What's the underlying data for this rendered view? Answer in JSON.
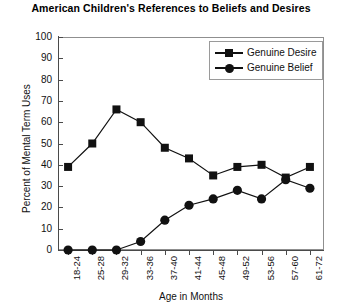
{
  "chart_data": {
    "type": "line",
    "title": "American Children's References to Beliefs and Desires",
    "xlabel": "Age in Months",
    "ylabel": "Percent of Mental Term Uses",
    "categories": [
      "18-24",
      "25-28",
      "29-32",
      "33-36",
      "37-40",
      "41-44",
      "45-48",
      "49-52",
      "53-56",
      "57-60",
      "61-72"
    ],
    "series": [
      {
        "name": "Genuine Desire",
        "marker": "square",
        "color": "#111111",
        "values": [
          39,
          50,
          66,
          60,
          48,
          43,
          35,
          39,
          40,
          34,
          39
        ]
      },
      {
        "name": "Genuine Belief",
        "marker": "circle",
        "color": "#111111",
        "values": [
          0,
          0,
          0,
          4,
          14,
          21,
          24,
          28,
          24,
          33,
          29
        ]
      }
    ],
    "ylim": [
      0,
      100
    ],
    "yticks": [
      0,
      10,
      20,
      30,
      40,
      50,
      60,
      70,
      80,
      90,
      100
    ],
    "ytick_labels": [
      "0",
      "10",
      "20",
      "30",
      "40",
      "50",
      "60",
      "70",
      "80",
      "90",
      "100"
    ],
    "grid": false,
    "legend_position": "top-right"
  },
  "legend": {
    "entries": [
      {
        "label": "Genuine Desire",
        "icon": "square-marker-icon"
      },
      {
        "label": "Genuine Belief",
        "icon": "circle-marker-icon"
      }
    ]
  }
}
